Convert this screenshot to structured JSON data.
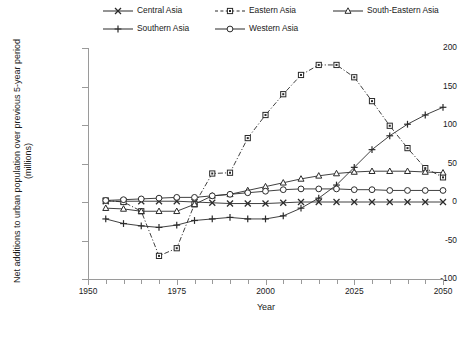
{
  "chart_data": {
    "type": "line",
    "title": "",
    "xlabel": "Year",
    "ylabel": "Net additions to urban population over previous 5-year period (millions)",
    "ylabel_line1": "Net additions to urban population over previous 5-year period",
    "ylabel_line2": "(millions)",
    "xlim": [
      1950,
      2050
    ],
    "ylim": [
      -100,
      200
    ],
    "ytick_values": [
      200,
      150,
      100,
      50,
      0,
      -50,
      -100
    ],
    "ytick_labels": [
      "200",
      "150",
      "100",
      "50",
      "0",
      "-50",
      "-100"
    ],
    "xtick_values": [
      1950,
      1975,
      2000,
      2025,
      2050
    ],
    "xtick_labels": [
      "1950",
      "1975",
      "2000",
      "2025",
      "2050"
    ],
    "x_minor_step": 5,
    "grid": false,
    "legend_position": "top",
    "x": [
      1955,
      1960,
      1965,
      1970,
      1975,
      1980,
      1985,
      1990,
      1995,
      2000,
      2005,
      2010,
      2015,
      2020,
      2025,
      2030,
      2035,
      2040,
      2045,
      2050
    ],
    "series": [
      {
        "name": "Central Asia",
        "marker": "x",
        "linestyle": "solid",
        "color": "#2b2b2b",
        "values": [
          1,
          1,
          1,
          1,
          1,
          0,
          -1,
          -2,
          -2,
          -2,
          -1,
          0,
          0,
          0,
          0,
          0,
          0,
          0,
          0,
          0
        ]
      },
      {
        "name": "Eastern Asia",
        "marker": "square",
        "linestyle": "dashdot",
        "color": "#2b2b2b",
        "values": [
          2,
          0,
          -12,
          -70,
          -60,
          -3,
          37,
          38,
          83,
          113,
          140,
          165,
          178,
          178,
          162,
          131,
          99,
          70,
          44,
          32
        ]
      },
      {
        "name": "South-Eastern Asia",
        "marker": "triangle",
        "linestyle": "solid",
        "color": "#2b2b2b",
        "values": [
          -8,
          -9,
          -12,
          -12,
          -12,
          -3,
          8,
          10,
          15,
          20,
          25,
          30,
          34,
          37,
          39,
          40,
          40,
          40,
          39,
          38
        ]
      },
      {
        "name": "Southern Asia",
        "marker": "plus",
        "linestyle": "solid",
        "color": "#2b2b2b",
        "values": [
          -22,
          -28,
          -31,
          -33,
          -30,
          -24,
          -22,
          -20,
          -22,
          -22,
          -18,
          -8,
          5,
          22,
          45,
          68,
          86,
          101,
          113,
          123
        ]
      },
      {
        "name": "Western Asia",
        "marker": "circle",
        "linestyle": "solid",
        "color": "#2b2b2b",
        "values": [
          2,
          3,
          4,
          5,
          6,
          6,
          8,
          10,
          12,
          14,
          16,
          17,
          17,
          17,
          16,
          16,
          15,
          15,
          15,
          15
        ]
      }
    ]
  },
  "legend": {
    "items": [
      {
        "label": "Central Asia",
        "marker": "x",
        "linestyle": "solid"
      },
      {
        "label": "Eastern Asia",
        "marker": "square",
        "linestyle": "dashdot"
      },
      {
        "label": "South-Eastern Asia",
        "marker": "triangle",
        "linestyle": "solid"
      },
      {
        "label": "Southern Asia",
        "marker": "plus",
        "linestyle": "solid"
      },
      {
        "label": "Western Asia",
        "marker": "circle",
        "linestyle": "solid"
      }
    ]
  }
}
